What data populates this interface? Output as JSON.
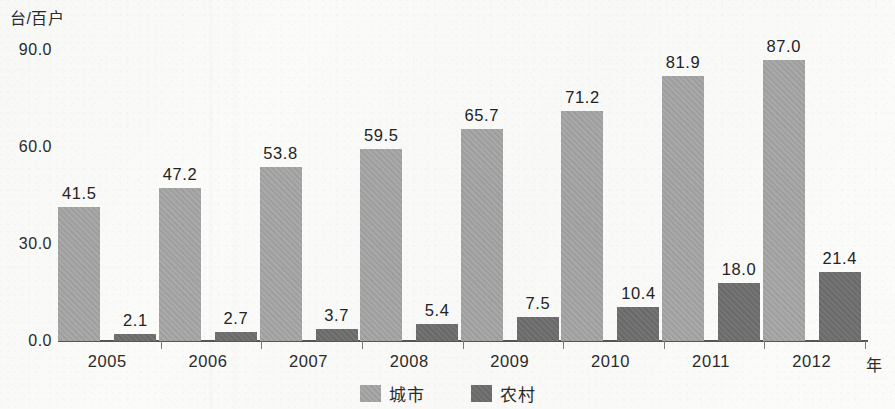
{
  "chart_data": {
    "type": "bar",
    "title": "",
    "subtitle": "",
    "xlabel": "年",
    "ylabel": "台/百户",
    "categories": [
      "2005",
      "2006",
      "2007",
      "2008",
      "2009",
      "2010",
      "2011",
      "2012"
    ],
    "series": [
      {
        "name": "城市",
        "color": "#a6a6a6",
        "values": [
          41.5,
          47.2,
          53.8,
          59.5,
          65.7,
          71.2,
          81.9,
          87.0
        ],
        "labels": [
          "41.5",
          "47.2",
          "53.8",
          "59.5",
          "65.7",
          "71.2",
          "81.9",
          "87.0"
        ]
      },
      {
        "name": "农村",
        "color": "#6e6e6e",
        "values": [
          2.1,
          2.7,
          3.7,
          5.4,
          7.5,
          10.4,
          18.0,
          21.4
        ],
        "labels": [
          "2.1",
          "2.7",
          "3.7",
          "5.4",
          "7.5",
          "10.4",
          "18.0",
          "21.4"
        ]
      }
    ],
    "ylim": [
      0,
      90
    ],
    "ytick_values": [
      90,
      60,
      30,
      0
    ],
    "ytick_labels": [
      "90.0",
      "60.0",
      "30.0",
      "0.0"
    ],
    "grid": false,
    "legend_position": "bottom-center",
    "bar_value_labels": true
  },
  "legend": {
    "items": [
      {
        "label": "城市",
        "color": "#a6a6a6"
      },
      {
        "label": "农村",
        "color": "#6e6e6e"
      }
    ]
  },
  "axes": {
    "y_unit_caption": "台/百户",
    "x_unit_caption": "年"
  }
}
